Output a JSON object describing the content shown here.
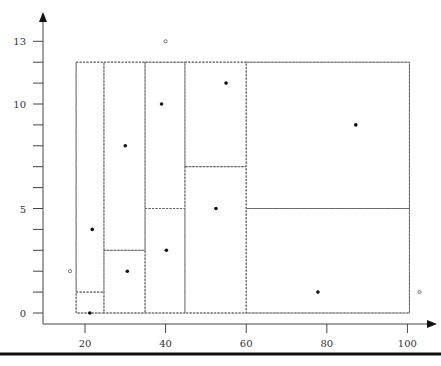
{
  "chart_data": {
    "type": "scatter",
    "title": "",
    "xlabel": "",
    "ylabel": "",
    "xlim": [
      15,
      105
    ],
    "ylim": [
      0,
      14
    ],
    "x_ticks": [
      20,
      40,
      60,
      80,
      100
    ],
    "y_ticks_labeled": [
      0,
      5,
      10,
      13
    ],
    "y_ticks_minor": [
      1,
      2,
      3,
      4,
      6,
      7,
      8,
      9,
      11,
      12
    ],
    "grid": false,
    "series": [
      {
        "name": "filled points",
        "marker": "filled-circle",
        "points": [
          {
            "x": 21.8,
            "y": 4
          },
          {
            "x": 21.2,
            "y": 0
          },
          {
            "x": 30,
            "y": 8
          },
          {
            "x": 30.5,
            "y": 2
          },
          {
            "x": 39,
            "y": 10
          },
          {
            "x": 40.2,
            "y": 3
          },
          {
            "x": 55,
            "y": 11
          },
          {
            "x": 52.5,
            "y": 5
          },
          {
            "x": 87.2,
            "y": 9
          },
          {
            "x": 77.8,
            "y": 1
          }
        ]
      },
      {
        "name": "open points",
        "marker": "open-circle",
        "points": [
          {
            "x": 40,
            "y": 13
          },
          {
            "x": 16.3,
            "y": 2
          },
          {
            "x": 103,
            "y": 1
          }
        ]
      }
    ],
    "partition": {
      "outer_box": {
        "x0": 17.8,
        "x1": 100.5,
        "y0": 0,
        "y1": 12
      },
      "cells": [
        {
          "x0": 17.8,
          "x1": 24.7,
          "y0": 0,
          "y1": 1
        },
        {
          "x0": 17.8,
          "x1": 24.7,
          "y0": 1,
          "y1": 12
        },
        {
          "x0": 24.7,
          "x1": 34.9,
          "y0": 0,
          "y1": 3
        },
        {
          "x0": 24.7,
          "x1": 34.9,
          "y0": 3,
          "y1": 12
        },
        {
          "x0": 34.9,
          "x1": 44.8,
          "y0": 0,
          "y1": 5
        },
        {
          "x0": 34.9,
          "x1": 44.8,
          "y0": 5,
          "y1": 12
        },
        {
          "x0": 44.8,
          "x1": 60,
          "y0": 0,
          "y1": 7
        },
        {
          "x0": 44.8,
          "x1": 60,
          "y0": 7,
          "y1": 12
        },
        {
          "x0": 60,
          "x1": 100.5,
          "y0": 0,
          "y1": 5
        },
        {
          "x0": 60,
          "x1": 100.5,
          "y0": 5,
          "y1": 12
        }
      ]
    }
  },
  "axes": {
    "x_labels": [
      "20",
      "40",
      "60",
      "80",
      "100"
    ],
    "y_labels": [
      "0",
      "5",
      "10",
      "13"
    ]
  },
  "colors": {
    "axis": "#444444",
    "dash": "#666666",
    "point": "#111111",
    "bottom_rule": "#111111"
  }
}
